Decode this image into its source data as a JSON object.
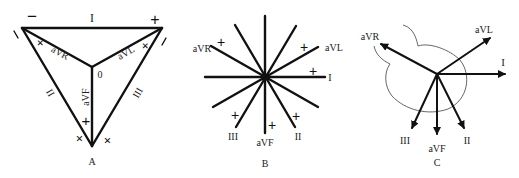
{
  "panels": {
    "A": {
      "caption": "A",
      "center_label": "0",
      "leads": {
        "I": "I",
        "II": "II",
        "III": "III",
        "aVR": "aVR",
        "aVL": "aVL",
        "aVF": "aVF"
      },
      "polarity": {
        "minus": "−",
        "plus": "+"
      }
    },
    "B": {
      "caption": "B",
      "leads": {
        "I": "I",
        "II": "II",
        "III": "III",
        "aVR": "aVR",
        "aVL": "aVL",
        "aVF": "aVF"
      },
      "plus": "+"
    },
    "C": {
      "caption": "C",
      "leads": {
        "I": "I",
        "II": "II",
        "III": "III",
        "aVR": "aVR",
        "aVL": "aVL",
        "aVF": "aVF"
      }
    }
  },
  "colors": {
    "line": "#111111",
    "text": "#222222",
    "background": "#ffffff"
  }
}
